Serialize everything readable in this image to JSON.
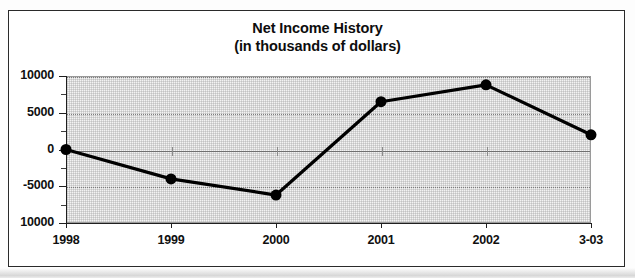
{
  "chart_data": {
    "type": "line",
    "title": "Net Income History",
    "subtitle": "(in thousands of dollars)",
    "xlabel": "",
    "ylabel": "",
    "categories": [
      "1998",
      "1999",
      "2000",
      "2001",
      "2002",
      "3-03"
    ],
    "values": [
      0,
      -4000,
      -6200,
      6500,
      8800,
      2000
    ],
    "series": [
      {
        "name": "Net Income",
        "values": [
          0,
          -4000,
          -6200,
          6500,
          8800,
          2000
        ]
      }
    ],
    "ylim": [
      -10000,
      10000
    ],
    "ytick_labels": [
      "10000",
      "5000",
      "0",
      "-5000",
      "10000"
    ],
    "ytick_values": [
      10000,
      5000,
      0,
      -5000,
      -10000
    ],
    "yminor_tick_values": [
      7500,
      2500,
      -2500,
      -7500
    ],
    "grid": true,
    "grid_axis": "y",
    "legend": false,
    "legend_position": "none",
    "marker": "circle",
    "marker_color": "#000000",
    "line_color": "#000000",
    "line_width": 3.2,
    "marker_size": 11,
    "plot_background": "#f3f3f3",
    "annotations": []
  },
  "colors": {
    "ink": "#101010",
    "frame": "#2a2a2a",
    "axis": "#1f1f1f",
    "gridline": "#7e7e7e",
    "plot_fill": "#f3f3f3",
    "series": "#000000"
  }
}
